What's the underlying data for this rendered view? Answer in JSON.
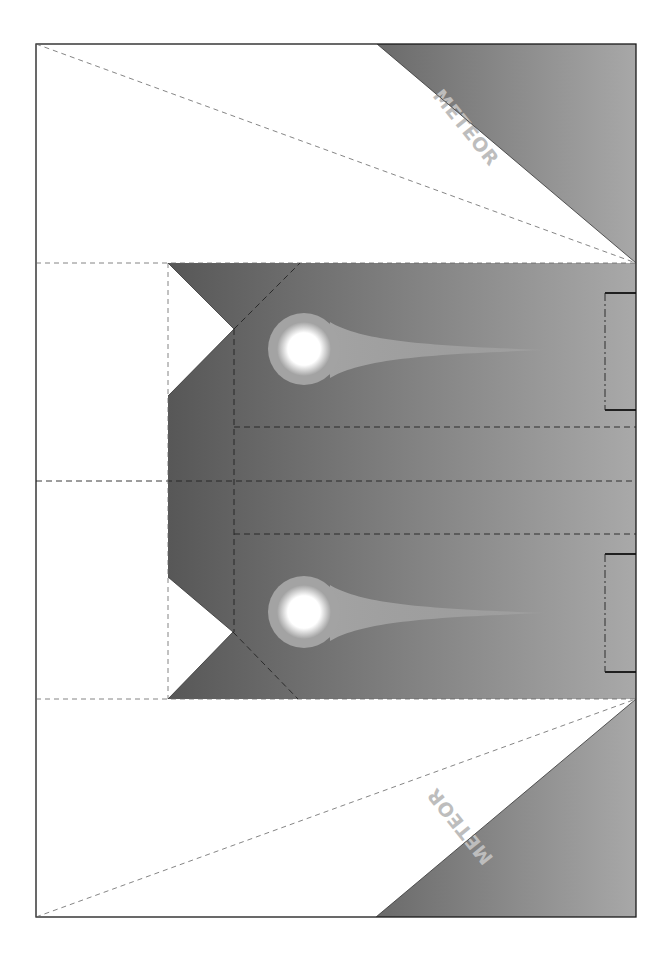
{
  "document": {
    "type": "paper-airplane-template",
    "title_top": "METEOR",
    "title_bottom": "METEOR"
  },
  "colors": {
    "gradient_dark": "#575757",
    "gradient_light": "#a9a9a9",
    "meteor_halo": "#a3a3a3",
    "meteor_core": "#ffffff",
    "paper": "#ffffff",
    "label": "#bdbdbd"
  },
  "layout": {
    "frame": {
      "x": 36,
      "y": 44,
      "width": 600,
      "height": 873
    },
    "center_panel": {
      "top": 263,
      "bottom": 699,
      "left": 168,
      "right": 636
    },
    "center_fold_y": 481,
    "inner_fold_x": 234,
    "upper_inner_fold_y": 427,
    "lower_inner_fold_y": 534
  },
  "meteors": [
    {
      "name": "upper-meteor",
      "cx": 304,
      "cy": 349
    },
    {
      "name": "lower-meteor",
      "cx": 304,
      "cy": 612
    }
  ],
  "tabs": [
    {
      "name": "upper-tab",
      "x": 605,
      "y": 293,
      "width": 31,
      "height": 117
    },
    {
      "name": "lower-tab",
      "x": 605,
      "y": 554,
      "width": 31,
      "height": 118
    }
  ]
}
